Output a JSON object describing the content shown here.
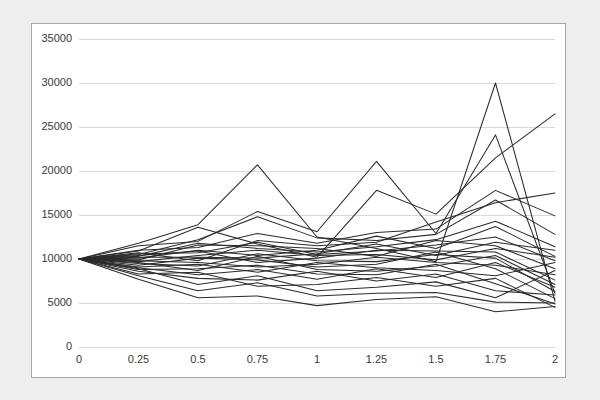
{
  "chart_data": {
    "type": "line",
    "title": "",
    "subtitle": "",
    "xlabel": "",
    "ylabel": "",
    "xlim": [
      0,
      2
    ],
    "ylim": [
      0,
      35000
    ],
    "x": [
      0,
      0.25,
      0.5,
      0.75,
      1,
      1.25,
      1.5,
      1.75,
      2
    ],
    "x_tick_labels": [
      "0",
      "0.25",
      "0.5",
      "0.75",
      "1",
      "1.25",
      "1.5",
      "1.75",
      "2"
    ],
    "y_ticks": [
      0,
      5000,
      10000,
      15000,
      20000,
      25000,
      30000,
      35000
    ],
    "y_tick_labels": [
      "0",
      "5000",
      "10000",
      "15000",
      "20000",
      "25000",
      "30000",
      "35000"
    ],
    "grid": "horizontal",
    "legend": "none",
    "line_color": "#2b2b2b",
    "grid_color": "#d9d9d9",
    "background_color": "#ffffff",
    "panel_border_color": "#a8a8a8",
    "page_background_color": "#eeeeee",
    "start_value": 10000,
    "series_count": 25,
    "series": [
      {
        "name": "path-01",
        "values": [
          10000,
          11800,
          13900,
          20700,
          12500,
          11200,
          9700,
          30000,
          5200
        ]
      },
      {
        "name": "path-02",
        "values": [
          10000,
          11500,
          12000,
          15400,
          13100,
          21100,
          12900,
          24100,
          6100
        ]
      },
      {
        "name": "path-03",
        "values": [
          10000,
          10900,
          13600,
          11700,
          10200,
          17800,
          15100,
          21500,
          26500
        ]
      },
      {
        "name": "path-04",
        "values": [
          10000,
          11000,
          11300,
          12900,
          11800,
          13000,
          13400,
          17800,
          14900
        ]
      },
      {
        "name": "path-05",
        "values": [
          10000,
          10500,
          12200,
          14800,
          12400,
          12100,
          12800,
          16700,
          12800
        ]
      },
      {
        "name": "path-06",
        "values": [
          10000,
          10700,
          9800,
          12100,
          11500,
          11900,
          14200,
          16400,
          17500
        ]
      },
      {
        "name": "path-07",
        "values": [
          10000,
          10300,
          11800,
          11200,
          10800,
          11400,
          12200,
          14300,
          11400
        ]
      },
      {
        "name": "path-08",
        "values": [
          10000,
          10100,
          11000,
          10400,
          11000,
          12600,
          11200,
          13700,
          10300
        ]
      },
      {
        "name": "path-09",
        "values": [
          10000,
          10600,
          10700,
          11900,
          10500,
          10900,
          11600,
          12500,
          9800
        ]
      },
      {
        "name": "path-10",
        "values": [
          10000,
          10200,
          10200,
          10100,
          10600,
          11700,
          10400,
          11900,
          11000
        ]
      },
      {
        "name": "path-11",
        "values": [
          10000,
          9900,
          11600,
          11500,
          11200,
          10300,
          12100,
          11500,
          8900
        ]
      },
      {
        "name": "path-12",
        "values": [
          10000,
          10400,
          10900,
          9600,
          10100,
          11000,
          10900,
          10800,
          7600
        ]
      },
      {
        "name": "path-13",
        "values": [
          10000,
          9700,
          10400,
          11000,
          10400,
          10500,
          9900,
          11200,
          10200
        ]
      },
      {
        "name": "path-14",
        "values": [
          10000,
          9500,
          9200,
          10600,
          9800,
          9700,
          10500,
          10100,
          6300
        ]
      },
      {
        "name": "path-15",
        "values": [
          10000,
          9800,
          9600,
          9100,
          9400,
          10200,
          9600,
          9300,
          8200
        ]
      },
      {
        "name": "path-16",
        "values": [
          10000,
          9300,
          10100,
          9900,
          9100,
          9400,
          10800,
          8900,
          5500
        ]
      },
      {
        "name": "path-17",
        "values": [
          10000,
          9600,
          8700,
          10300,
          8800,
          8600,
          9200,
          10400,
          7100
        ]
      },
      {
        "name": "path-18",
        "values": [
          10000,
          9100,
          9400,
          8500,
          9600,
          9000,
          8700,
          8100,
          9600
        ]
      },
      {
        "name": "path-19",
        "values": [
          10000,
          8800,
          8900,
          9300,
          8300,
          8200,
          9400,
          7200,
          4900
        ]
      },
      {
        "name": "path-20",
        "values": [
          10000,
          9000,
          8200,
          8800,
          7700,
          8900,
          7900,
          9600,
          6800
        ]
      },
      {
        "name": "path-21",
        "values": [
          10000,
          8600,
          7800,
          7600,
          8600,
          7500,
          8300,
          6400,
          5900
        ]
      },
      {
        "name": "path-22",
        "values": [
          10000,
          8300,
          8500,
          6900,
          7100,
          7900,
          6900,
          7800,
          4500
        ]
      },
      {
        "name": "path-23",
        "values": [
          10000,
          8900,
          7100,
          8100,
          6400,
          6800,
          7400,
          5600,
          8700
        ]
      },
      {
        "name": "path-24",
        "values": [
          10000,
          8100,
          6400,
          7300,
          5800,
          6100,
          6200,
          5100,
          5000
        ]
      },
      {
        "name": "path-25",
        "values": [
          10000,
          7700,
          5600,
          5800,
          4700,
          5400,
          5700,
          4000,
          4600
        ]
      }
    ]
  }
}
